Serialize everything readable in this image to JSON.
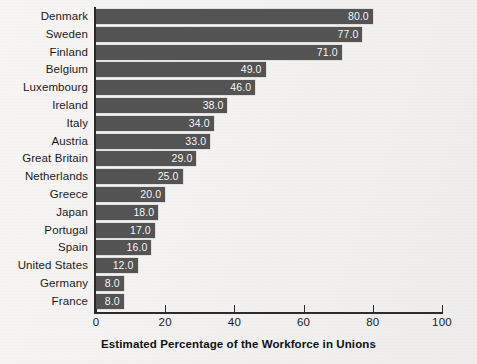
{
  "chart_data": {
    "type": "bar",
    "orientation": "horizontal",
    "title": "",
    "xlabel": "Estimated Percentage of the Workforce in Unions",
    "ylabel": "",
    "xlim": [
      0,
      100
    ],
    "xticks": [
      "0",
      "20",
      "40",
      "60",
      "80",
      "100"
    ],
    "grid": false,
    "legend": false,
    "bar_color": "#545454",
    "value_label_color": "#ffffff",
    "categories": [
      "Denmark",
      "Sweden",
      "Finland",
      "Belgium",
      "Luxembourg",
      "Ireland",
      "Italy",
      "Austria",
      "Great Britain",
      "Netherlands",
      "Greece",
      "Japan",
      "Portugal",
      "Spain",
      "United States",
      "Germany",
      "France"
    ],
    "values": [
      80.0,
      77.0,
      71.0,
      49.0,
      46.0,
      38.0,
      34.0,
      33.0,
      29.0,
      25.0,
      20.0,
      18.0,
      17.0,
      16.0,
      12.0,
      8.0,
      8.0
    ],
    "value_labels": [
      "80.0",
      "77.0",
      "71.0",
      "49.0",
      "46.0",
      "38.0",
      "34.0",
      "33.0",
      "29.0",
      "25.0",
      "20.0",
      "18.0",
      "17.0",
      "16.0",
      "12.0",
      "8.0",
      "8.0"
    ]
  }
}
